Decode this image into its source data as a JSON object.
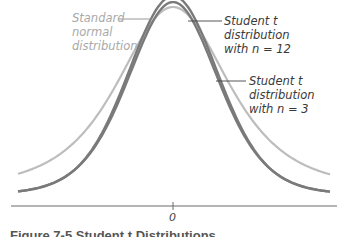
{
  "chart_data": {
    "type": "line",
    "title": "",
    "xlabel": "",
    "ylabel": "",
    "x_ticks": [
      "0"
    ],
    "grid": false,
    "legend_position": "inline annotations",
    "series": [
      {
        "name": "Standard normal distribution",
        "color": "#b0b0b0",
        "peak_height_rel": 0.92,
        "tail": "light"
      },
      {
        "name": "Student t distribution with n = 12",
        "color": "#6e6e6e",
        "peak_height_rel": 1.0,
        "tail": "medium"
      },
      {
        "name": "Student t distribution with n = 3",
        "color": "#6e6e6e",
        "peak_height_rel": 0.97,
        "tail": "heavy"
      }
    ],
    "annotations": [
      {
        "text": [
          "Standard",
          "normal",
          "distribution"
        ]
      },
      {
        "text": [
          "Student t",
          "distribution",
          "with n = 12"
        ]
      },
      {
        "text": [
          "Student t",
          "distribution",
          "with n = 3"
        ]
      }
    ]
  },
  "labels": {
    "normal": {
      "l1": "Standard",
      "l2": "normal",
      "l3": "distribution"
    },
    "t12": {
      "l1": "Student t",
      "l2": "distribution",
      "l3": "with n = 12"
    },
    "t3": {
      "l1": "Student t",
      "l2": "distribution",
      "l3": "with n = 3"
    }
  },
  "axis": {
    "zero_label": "0"
  },
  "caption": "Figure 7-5  Student t Distributions"
}
